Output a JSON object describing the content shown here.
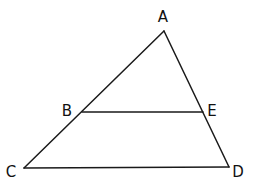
{
  "diagram": {
    "type": "triangle-with-parallel-segment",
    "stroke_color": "#1a1a1a",
    "label_color": "#111111",
    "points": {
      "A": {
        "label": "A",
        "x": 164,
        "y": 31,
        "lx": 163,
        "ly": 22
      },
      "B": {
        "label": "B",
        "x": 82,
        "y": 112,
        "lx": 67,
        "ly": 116
      },
      "E": {
        "label": "E",
        "x": 203,
        "y": 112,
        "lx": 212,
        "ly": 116
      },
      "C": {
        "label": "C",
        "x": 24,
        "y": 168,
        "lx": 11,
        "ly": 177
      },
      "D": {
        "label": "D",
        "x": 229,
        "y": 167,
        "lx": 238,
        "ly": 177
      }
    },
    "segments": [
      {
        "from": "A",
        "to": "C"
      },
      {
        "from": "A",
        "to": "D"
      },
      {
        "from": "C",
        "to": "D"
      },
      {
        "from": "B",
        "to": "E"
      }
    ]
  }
}
